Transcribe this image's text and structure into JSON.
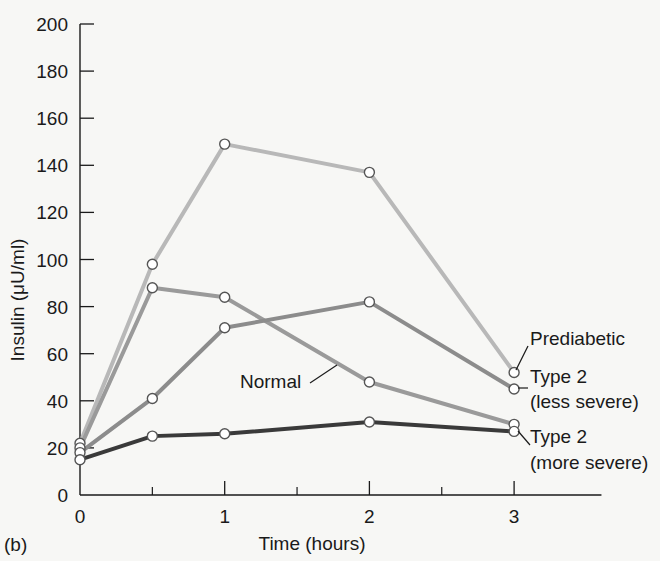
{
  "panel_label": "(b)",
  "chart_data": {
    "type": "line",
    "title": "",
    "xlabel": "Time (hours)",
    "ylabel": "Insulin (μU/ml)",
    "xlim": [
      0,
      3.5
    ],
    "ylim": [
      0,
      200
    ],
    "x_ticks": [
      0,
      1,
      2,
      3
    ],
    "x_minor_ticks": [
      0.5,
      1.5,
      2.5
    ],
    "y_ticks": [
      0,
      20,
      40,
      60,
      80,
      100,
      120,
      140,
      160,
      180,
      200
    ],
    "grid": false,
    "legend_position": "inline labels at right",
    "x": [
      0,
      0.5,
      1,
      2,
      3
    ],
    "series": [
      {
        "name": "Prediabetic",
        "color": "#b8b8b8",
        "values": [
          22,
          98,
          149,
          137,
          52
        ]
      },
      {
        "name": "Normal",
        "color": "#9a9a9a",
        "values": [
          20,
          88,
          84,
          48,
          30
        ]
      },
      {
        "name": "Type 2 (less severe)",
        "color": "#8c8c8c",
        "values": [
          18,
          41,
          71,
          82,
          45
        ]
      },
      {
        "name": "Type 2 (more severe)",
        "color": "#3a3a3a",
        "values": [
          15,
          25,
          26,
          31,
          27
        ]
      }
    ]
  },
  "labels": {
    "prediabetic": "Prediabetic",
    "normal": "Normal",
    "type2_less_line1": "Type 2",
    "type2_less_line2": "(less severe)",
    "type2_more_line1": "Type 2",
    "type2_more_line2": "(more severe)"
  }
}
